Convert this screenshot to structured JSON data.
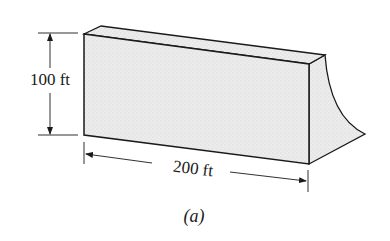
{
  "figure": {
    "caption": "(a)",
    "height_label": "100 ft",
    "width_label": "200 ft",
    "colors": {
      "stroke": "#1a1a1a",
      "fill": "#e9e9e9",
      "background": "#ffffff"
    }
  }
}
